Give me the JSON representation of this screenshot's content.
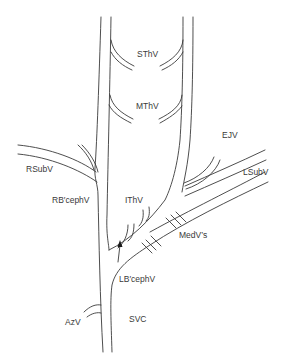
{
  "diagram": {
    "type": "anatomical venous diagram",
    "labels": {
      "sthv": "SThV",
      "mthv": "MThV",
      "ejv": "EJV",
      "rsubv": "RSubV",
      "lsubv": "LSubV",
      "rbcephv": "RB′cephV",
      "ithv": "IThV",
      "medvs": "MedV’s",
      "lbcephv": "LB′cephV",
      "azv": "AzV",
      "svc": "SVC"
    },
    "colors": {
      "stroke": "#3a3a3a",
      "background": "#ffffff"
    }
  }
}
